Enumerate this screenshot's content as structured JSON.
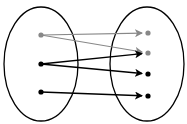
{
  "diagram": {
    "type": "function-mapping",
    "domain_set": {
      "ellipse": {
        "cx": 41,
        "cy": 64,
        "rx": 37,
        "ry": 57
      },
      "points": [
        {
          "id": "d1",
          "x": 41,
          "y": 35,
          "color": "#888888"
        },
        {
          "id": "d2",
          "x": 41,
          "y": 64,
          "color": "#000000"
        },
        {
          "id": "d3",
          "x": 41,
          "y": 92,
          "color": "#000000"
        }
      ]
    },
    "codomain_set": {
      "ellipse": {
        "cx": 147,
        "cy": 64,
        "rx": 37,
        "ry": 57
      },
      "points": [
        {
          "id": "c1",
          "x": 148,
          "y": 33,
          "color": "#888888"
        },
        {
          "id": "c2",
          "x": 148,
          "y": 53,
          "color": "#888888"
        },
        {
          "id": "c3",
          "x": 148,
          "y": 74,
          "color": "#000000"
        },
        {
          "id": "c4",
          "x": 148,
          "y": 96,
          "color": "#000000"
        }
      ]
    },
    "arrows": [
      {
        "from": "d1",
        "to": "c1",
        "color": "#888888"
      },
      {
        "from": "d1",
        "to": "c2",
        "color": "#888888"
      },
      {
        "from": "d2",
        "to": "c2",
        "color": "#000000"
      },
      {
        "from": "d2",
        "to": "c3",
        "color": "#000000"
      },
      {
        "from": "d3",
        "to": "c4",
        "color": "#000000"
      }
    ]
  }
}
